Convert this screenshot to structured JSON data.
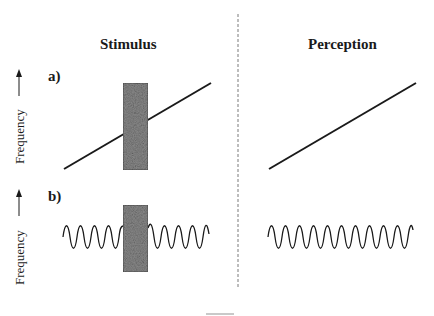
{
  "columns": {
    "stimulus": {
      "title": "Stimulus"
    },
    "perception": {
      "title": "Perception"
    }
  },
  "panels": [
    {
      "label": "a)",
      "y_axis_label": "Frequency",
      "stimulus": {
        "signal": "rising-line",
        "occluder": "noise-burst"
      },
      "perception": {
        "signal": "rising-line"
      }
    },
    {
      "label": "b)",
      "y_axis_label": "Frequency",
      "stimulus": {
        "signal": "sine-wave",
        "occluder": "noise-burst"
      },
      "perception": {
        "signal": "sine-wave"
      }
    }
  ],
  "divider": {
    "style": "dashed"
  },
  "colors": {
    "ink": "#1a1a1a",
    "noise_fill": "#8a8a8a",
    "noise_border": "#555555",
    "divider": "#7a7a7a"
  }
}
